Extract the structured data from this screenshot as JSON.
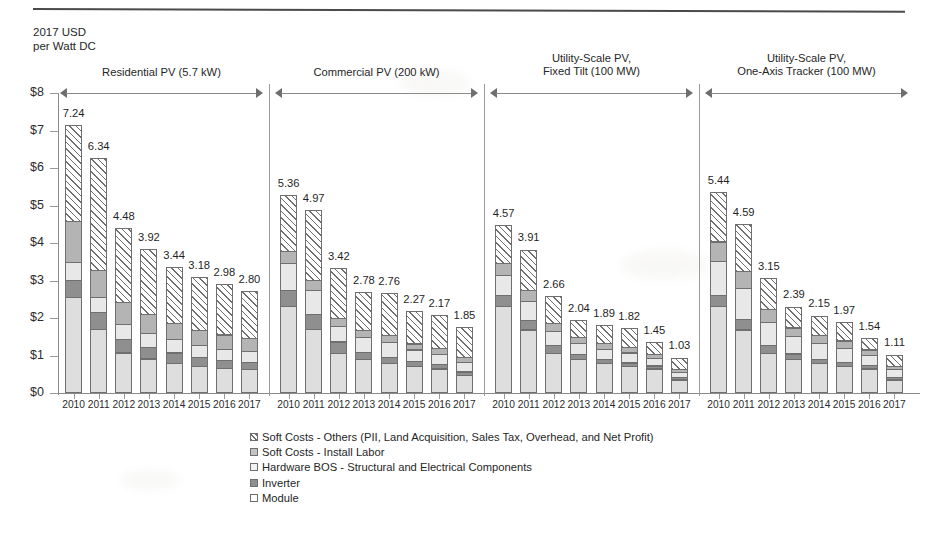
{
  "axis_title_lines": [
    "2017 USD",
    "per Watt DC"
  ],
  "y_axis": {
    "ticks": [
      "$0",
      "$1",
      "$2",
      "$3",
      "$4",
      "$5",
      "$6",
      "$7",
      "$8"
    ],
    "min": 0,
    "max": 8
  },
  "legend": {
    "items": [
      {
        "key": "soft",
        "label": "Soft Costs - Others (PII, Land Acquisition, Sales Tax, Overhead, and Net Profit)"
      },
      {
        "key": "labor",
        "label": "Soft Costs - Install Labor"
      },
      {
        "key": "bos",
        "label": "Hardware BOS - Structural and Electrical Components"
      },
      {
        "key": "inverter",
        "label": "Inverter"
      },
      {
        "key": "module",
        "label": "Module"
      }
    ]
  },
  "chart_data": {
    "type": "bar",
    "stacked": true,
    "title": "",
    "subtitle": "",
    "xlabel": "",
    "ylabel": "2017 USD per Watt DC",
    "ylim": [
      0,
      8
    ],
    "ytick_labels": [
      "$0",
      "$1",
      "$2",
      "$3",
      "$4",
      "$5",
      "$6",
      "$7",
      "$8"
    ],
    "grid": false,
    "legend_position": "bottom-left",
    "series_order_bottom_to_top": [
      "Module",
      "Inverter",
      "Hardware BOS - Structural and Electrical Components",
      "Soft Costs - Install Labor",
      "Soft Costs - Others (PII, Land Acquisition, Sales Tax, Overhead, and Net Profit)"
    ],
    "categories": [
      "2010",
      "2011",
      "2012",
      "2013",
      "2014",
      "2015",
      "2016",
      "2017"
    ],
    "groups": [
      {
        "name": "Residential PV (5.7 kW)",
        "header_lines": [
          "Residential PV (5.7 kW)"
        ],
        "totals": [
          7.24,
          6.34,
          4.48,
          3.92,
          3.44,
          3.18,
          2.98,
          2.8
        ],
        "series": [
          {
            "name": "Module",
            "values": [
              2.55,
              1.71,
              1.08,
              0.92,
              0.8,
              0.72,
              0.66,
              0.63
            ]
          },
          {
            "name": "Inverter",
            "values": [
              0.48,
              0.46,
              0.37,
              0.33,
              0.3,
              0.25,
              0.23,
              0.21
            ]
          },
          {
            "name": "Hardware BOS",
            "values": [
              0.5,
              0.44,
              0.43,
              0.4,
              0.37,
              0.35,
              0.33,
              0.32
            ]
          },
          {
            "name": "Install Labor",
            "values": [
              1.11,
              0.74,
              0.6,
              0.52,
              0.46,
              0.42,
              0.4,
              0.37
            ]
          },
          {
            "name": "Soft Others",
            "values": [
              2.6,
              2.99,
              2.0,
              1.75,
              1.51,
              1.44,
              1.36,
              1.27
            ]
          }
        ]
      },
      {
        "name": "Commercial PV (200 kW)",
        "header_lines": [
          "Commercial PV (200 kW)"
        ],
        "totals": [
          5.36,
          4.97,
          3.42,
          2.78,
          2.76,
          2.27,
          2.17,
          1.85
        ],
        "series": [
          {
            "name": "Module",
            "values": [
              2.31,
              1.7,
              1.06,
              0.91,
              0.79,
              0.71,
              0.65,
              0.47
            ]
          },
          {
            "name": "Inverter",
            "values": [
              0.45,
              0.42,
              0.33,
              0.2,
              0.18,
              0.16,
              0.14,
              0.12
            ]
          },
          {
            "name": "Hardware BOS",
            "values": [
              0.74,
              0.67,
              0.44,
              0.42,
              0.42,
              0.33,
              0.3,
              0.28
            ]
          },
          {
            "name": "Install Labor",
            "values": [
              0.34,
              0.29,
              0.24,
              0.22,
              0.22,
              0.18,
              0.17,
              0.16
            ]
          },
          {
            "name": "Soft Others",
            "values": [
              1.52,
              1.89,
              1.35,
              1.03,
              1.15,
              0.89,
              0.91,
              0.82
            ]
          }
        ]
      },
      {
        "name": "Utility-Scale PV, Fixed Tilt (100 MW)",
        "header_lines": [
          "Utility-Scale PV,",
          "Fixed Tilt (100 MW)"
        ],
        "totals": [
          4.57,
          3.91,
          2.66,
          2.04,
          1.89,
          1.82,
          1.45,
          1.03
        ],
        "series": [
          {
            "name": "Module",
            "values": [
              2.31,
              1.69,
              1.06,
              0.91,
              0.79,
              0.71,
              0.65,
              0.36
            ]
          },
          {
            "name": "Inverter",
            "values": [
              0.33,
              0.28,
              0.23,
              0.15,
              0.13,
              0.12,
              0.1,
              0.08
            ]
          },
          {
            "name": "Hardware BOS",
            "values": [
              0.55,
              0.52,
              0.4,
              0.32,
              0.3,
              0.29,
              0.22,
              0.17
            ]
          },
          {
            "name": "Install Labor",
            "values": [
              0.34,
              0.31,
              0.23,
              0.18,
              0.17,
              0.16,
              0.13,
              0.1
            ]
          },
          {
            "name": "Soft Others",
            "values": [
              1.04,
              1.11,
              0.74,
              0.48,
              0.5,
              0.54,
              0.35,
              0.32
            ]
          }
        ]
      },
      {
        "name": "Utility-Scale PV, One-Axis Tracker (100 MW)",
        "header_lines": [
          "Utility-Scale PV,",
          "One-Axis Tracker (100 MW)"
        ],
        "totals": [
          5.44,
          4.59,
          3.15,
          2.39,
          2.15,
          1.97,
          1.54,
          1.11
        ],
        "series": [
          {
            "name": "Module",
            "values": [
              2.31,
              1.69,
              1.06,
              0.91,
              0.79,
              0.71,
              0.65,
              0.36
            ]
          },
          {
            "name": "Inverter",
            "values": [
              0.33,
              0.3,
              0.24,
              0.16,
              0.14,
              0.13,
              0.11,
              0.09
            ]
          },
          {
            "name": "Hardware BOS",
            "values": [
              0.93,
              0.85,
              0.64,
              0.48,
              0.44,
              0.4,
              0.3,
              0.22
            ]
          },
          {
            "name": "Install Labor",
            "values": [
              0.53,
              0.48,
              0.37,
              0.26,
              0.24,
              0.22,
              0.16,
              0.12
            ]
          },
          {
            "name": "Soft Others",
            "values": [
              1.34,
              1.27,
              0.84,
              0.58,
              0.54,
              0.51,
              0.32,
              0.32
            ]
          }
        ]
      }
    ]
  }
}
